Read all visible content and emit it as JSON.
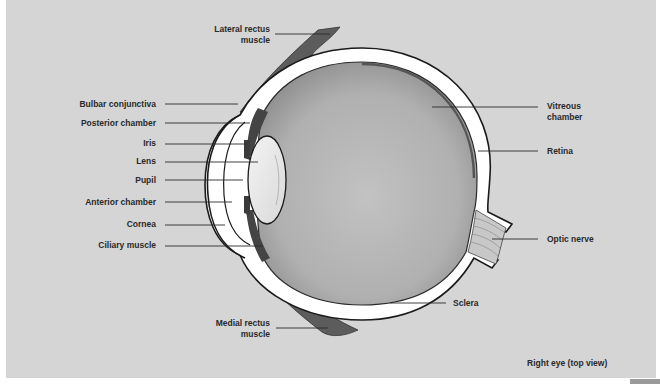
{
  "diagram": {
    "title": "Right eye (top view)",
    "labels": {
      "lateral_rectus": "Lateral rectus muscle",
      "lateral_rectus_l1": "Lateral rectus",
      "lateral_rectus_l2": "muscle",
      "bulbar_conjunctiva": "Bulbar conjunctiva",
      "posterior_chamber": "Posterior chamber",
      "iris": "Iris",
      "lens": "Lens",
      "pupil": "Pupil",
      "anterior_chamber": "Anterior chamber",
      "cornea": "Cornea",
      "ciliary_muscle": "Ciliary muscle",
      "medial_rectus_l1": "Medial rectus",
      "medial_rectus_l2": "muscle",
      "vitreous_l1": "Vitreous",
      "vitreous_l2": "chamber",
      "retina": "Retina",
      "optic_nerve": "Optic nerve",
      "sclera": "Sclera"
    },
    "colors": {
      "background": "#d5d5d5",
      "sclera": "#ffffff",
      "vitreous": "#b4b4b4",
      "muscle": "#5c5c5c",
      "outline": "#1a1a1a"
    }
  }
}
